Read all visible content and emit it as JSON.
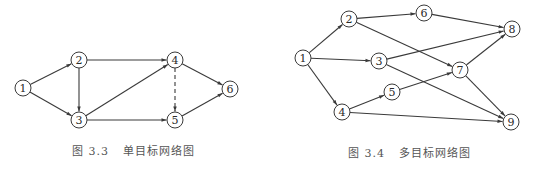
{
  "figures": [
    {
      "id": "fig-3-3",
      "caption_label": "图 3.3",
      "caption_title": "单目标网络图",
      "nodes": [
        {
          "id": "1",
          "label": "1",
          "x": 23,
          "y": 88
        },
        {
          "id": "2",
          "label": "2",
          "x": 79,
          "y": 60
        },
        {
          "id": "3",
          "label": "3",
          "x": 79,
          "y": 120
        },
        {
          "id": "4",
          "label": "4",
          "x": 175,
          "y": 60
        },
        {
          "id": "5",
          "label": "5",
          "x": 175,
          "y": 120
        },
        {
          "id": "6",
          "label": "6",
          "x": 230,
          "y": 89
        }
      ],
      "edges": [
        {
          "from": "1",
          "to": "2",
          "style": "solid"
        },
        {
          "from": "1",
          "to": "3",
          "style": "solid"
        },
        {
          "from": "2",
          "to": "3",
          "style": "solid"
        },
        {
          "from": "2",
          "to": "4",
          "style": "solid"
        },
        {
          "from": "3",
          "to": "4",
          "style": "solid"
        },
        {
          "from": "3",
          "to": "5",
          "style": "solid"
        },
        {
          "from": "4",
          "to": "5",
          "style": "dashed"
        },
        {
          "from": "4",
          "to": "6",
          "style": "solid"
        },
        {
          "from": "5",
          "to": "6",
          "style": "solid"
        }
      ]
    },
    {
      "id": "fig-3-4",
      "caption_label": "图 3.4",
      "caption_title": "多目标网络图",
      "nodes": [
        {
          "id": "1",
          "label": "1",
          "x": 303,
          "y": 58
        },
        {
          "id": "2",
          "label": "2",
          "x": 349,
          "y": 19
        },
        {
          "id": "3",
          "label": "3",
          "x": 379,
          "y": 61
        },
        {
          "id": "4",
          "label": "4",
          "x": 342,
          "y": 112
        },
        {
          "id": "5",
          "label": "5",
          "x": 392,
          "y": 92
        },
        {
          "id": "6",
          "label": "6",
          "x": 424,
          "y": 13
        },
        {
          "id": "7",
          "label": "7",
          "x": 460,
          "y": 70
        },
        {
          "id": "8",
          "label": "8",
          "x": 512,
          "y": 29
        },
        {
          "id": "9",
          "label": "9",
          "x": 511,
          "y": 122
        }
      ],
      "edges": [
        {
          "from": "1",
          "to": "2",
          "style": "solid"
        },
        {
          "from": "1",
          "to": "3",
          "style": "solid"
        },
        {
          "from": "1",
          "to": "4",
          "style": "solid"
        },
        {
          "from": "2",
          "to": "6",
          "style": "solid"
        },
        {
          "from": "2",
          "to": "7",
          "style": "solid"
        },
        {
          "from": "6",
          "to": "8",
          "style": "solid"
        },
        {
          "from": "3",
          "to": "8",
          "style": "solid"
        },
        {
          "from": "3",
          "to": "9",
          "style": "solid"
        },
        {
          "from": "4",
          "to": "5",
          "style": "solid"
        },
        {
          "from": "5",
          "to": "7",
          "style": "solid"
        },
        {
          "from": "4",
          "to": "9",
          "style": "solid"
        },
        {
          "from": "7",
          "to": "8",
          "style": "solid"
        },
        {
          "from": "7",
          "to": "9",
          "style": "solid"
        }
      ]
    }
  ]
}
